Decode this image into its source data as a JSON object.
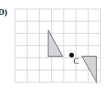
{
  "figure": {
    "problem_label": "D)",
    "background_color": "#ffffff"
  },
  "grid": {
    "line_color": "#d8d8dc",
    "line_width": 0.9,
    "cell_size": 12.2,
    "columns": 7,
    "rows": 6,
    "left": 15.0,
    "top": 9.0,
    "right": 100.4,
    "bottom": 82.2
  },
  "shapes": {
    "fill_color": "#d5d5d8",
    "stroke_color": "#8d8d93",
    "stroke_width": 1.1,
    "preimage": {
      "name": "preimage-triangle",
      "points": "48.2,30.0 48.2,56.4 62.6,56.4",
      "vertices": [
        {
          "x": 48.2,
          "y": 30.0
        },
        {
          "x": 48.2,
          "y": 56.4
        },
        {
          "x": 62.6,
          "y": 56.4
        }
      ]
    },
    "image": {
      "name": "image-triangle",
      "points": "82.0,56.4 96.4,56.4 96.4,82.0",
      "vertices": [
        {
          "x": 82.0,
          "y": 56.4
        },
        {
          "x": 96.4,
          "y": 56.4
        },
        {
          "x": 96.4,
          "y": 82.0
        }
      ]
    }
  },
  "center_point": {
    "name": "C",
    "label": "C",
    "x": 71.6,
    "y": 55.2,
    "radius": 2.4,
    "color": "#111111",
    "label_x": 73.4,
    "label_y": 64.0
  }
}
